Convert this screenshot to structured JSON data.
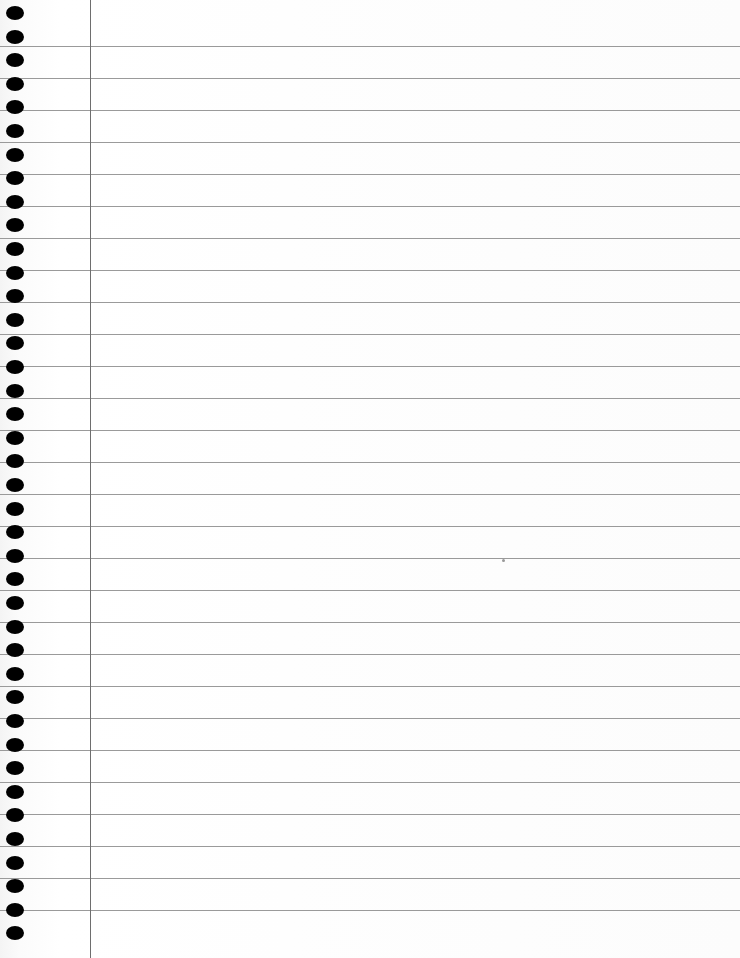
{
  "page": {
    "type": "lined-notebook-paper",
    "background_color": "#fdfdfd",
    "rule_color": "#9a9a9a",
    "margin_line_color": "#6e6e6e",
    "hole_color": "#000000"
  },
  "rules": {
    "first_y": 46,
    "spacing": 32,
    "count": 28
  },
  "margin": {
    "x": 90
  },
  "holes": {
    "first_y": 6,
    "spacing": 23.6,
    "count": 40
  }
}
